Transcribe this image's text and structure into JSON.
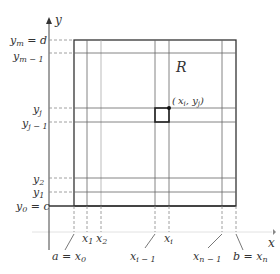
{
  "diagram": {
    "region_label": "R",
    "point_label": "( x_i, y_j )",
    "axes": {
      "x_label": "x",
      "y_label": "y"
    },
    "y_labels": [
      {
        "main": "y",
        "sub": "m",
        "suffix": " = d",
        "y": 40
      },
      {
        "main": "y",
        "sub": "m − 1",
        "suffix": "",
        "y": 53
      },
      {
        "main": "y",
        "sub": "j",
        "suffix": "",
        "y": 108
      },
      {
        "main": "y",
        "sub": "j − 1",
        "suffix": "",
        "y": 122
      },
      {
        "main": "y",
        "sub": "2",
        "suffix": "",
        "y": 178
      },
      {
        "main": "y",
        "sub": "1",
        "suffix": "",
        "y": 192
      },
      {
        "main": "y",
        "sub": "0",
        "suffix": " = c",
        "y": 206
      }
    ],
    "x_labels": [
      {
        "prefix": "a = ",
        "main": "x",
        "sub": "0",
        "x": 74
      },
      {
        "prefix": "",
        "main": "x",
        "sub": "1",
        "x": 87
      },
      {
        "prefix": "",
        "main": "x",
        "sub": "2",
        "x": 101
      },
      {
        "prefix": "",
        "main": "x",
        "sub": "i − 1",
        "x": 155
      },
      {
        "prefix": "",
        "main": "x",
        "sub": "i",
        "x": 169
      },
      {
        "prefix": "",
        "main": "x",
        "sub": "n − 1",
        "x": 222
      },
      {
        "prefix": "b = ",
        "main": "x",
        "sub": "n",
        "x": 236
      }
    ],
    "colors": {
      "line": "#333333",
      "grid": "#555555",
      "axis_faint": "#dddddd"
    }
  }
}
